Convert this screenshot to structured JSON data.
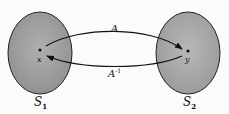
{
  "diagram": {
    "sets": [
      {
        "id": "S1",
        "label": "S",
        "subscript": "1",
        "fill": "#9e9e9e",
        "cx": 47,
        "cy": 50,
        "rx": 24,
        "ry": 43
      },
      {
        "id": "S2",
        "label": "S",
        "subscript": "2",
        "fill": "#a8a8a8",
        "cx": 189,
        "cy": 50,
        "rx": 31,
        "ry": 43
      }
    ],
    "points": [
      {
        "id": "x",
        "label": "x",
        "set": "S1",
        "cx": 40,
        "cy": 50
      },
      {
        "id": "y",
        "label": "y",
        "set": "S2",
        "cx": 188,
        "cy": 51
      }
    ],
    "arrows": [
      {
        "id": "A",
        "label": "A",
        "from": "x",
        "to": "y",
        "direction": "upper"
      },
      {
        "id": "A_inv",
        "label": "A",
        "superscript": "-1",
        "from": "y",
        "to": "x",
        "direction": "lower"
      }
    ]
  }
}
